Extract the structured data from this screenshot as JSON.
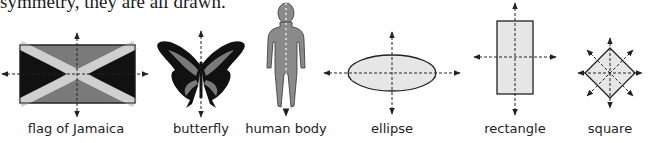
{
  "intro_text": "symmetry, they are all drawn.",
  "figures": [
    {
      "id": "flag",
      "caption": "flag of Jamaica",
      "center_x": 76
    },
    {
      "id": "butterfly",
      "caption": "butterfly",
      "center_x": 201
    },
    {
      "id": "human",
      "caption": "human body",
      "center_x": 286
    },
    {
      "id": "ellipse",
      "caption": "ellipse",
      "center_x": 392
    },
    {
      "id": "rectangle",
      "caption": "rectangle",
      "center_x": 515
    },
    {
      "id": "square",
      "caption": "square",
      "center_x": 610
    }
  ],
  "colors": {
    "flag_dark": "#111111",
    "flag_mid": "#7a7a7a",
    "flag_cross": "#cfcfcf",
    "shape_fill": "#e6e6e6",
    "figure_gray": "#8a8a8a",
    "line": "#222222"
  }
}
